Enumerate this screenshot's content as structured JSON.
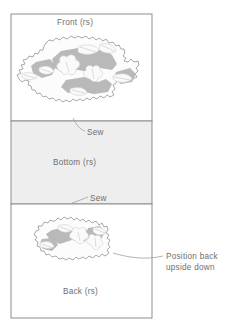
{
  "diagram": {
    "title_implied": "Fabric piece layout for sewing",
    "panels": [
      {
        "id": "front",
        "label": "Front (rs)",
        "fill": "#ffffff",
        "has_fabric_piece": true
      },
      {
        "id": "bottom",
        "label": "Bottom (rs)",
        "fill": "#eeeeee",
        "has_fabric_piece": false
      },
      {
        "id": "back",
        "label": "Back (rs)",
        "fill": "#ffffff",
        "has_fabric_piece": true
      }
    ],
    "seam_labels": [
      {
        "id": "sew-top",
        "text": "Sew"
      },
      {
        "id": "sew-bottom",
        "text": "Sew"
      }
    ],
    "callout": {
      "line1": "Position back",
      "line2": "upside down"
    },
    "colors": {
      "border": "#8d8d8d",
      "panel_fill_gray": "#eeeeee",
      "panel_fill_white": "#ffffff",
      "fabric_outline": "#8e8e8e",
      "fabric_base": "#fbfbfb",
      "fabric_patch_gray": "#b9b9b9",
      "fabric_patch_light": "#e2e2e2",
      "text": "#6e6e6e",
      "leader_line": "#a0a0a0"
    }
  }
}
